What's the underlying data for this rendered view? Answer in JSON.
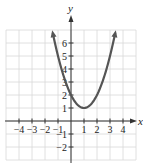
{
  "chart_data": {
    "type": "line",
    "title": "",
    "xlabel": "x",
    "ylabel": "y",
    "xlim": [
      -5,
      5
    ],
    "ylim": [
      -3,
      7
    ],
    "grid": true,
    "x_ticks": [
      -4,
      -3,
      -2,
      -1,
      1,
      2,
      3,
      4
    ],
    "y_ticks": [
      -2,
      -1,
      1,
      2,
      3,
      4,
      5,
      6
    ],
    "x_tick_labels": [
      "−4",
      "−3",
      "−2",
      "−1",
      "1",
      "2",
      "3",
      "4"
    ],
    "y_tick_labels": [
      "−2",
      "−1",
      "1",
      "2",
      "3",
      "4",
      "5",
      "6"
    ],
    "series": [
      {
        "name": "parabola",
        "equation": "y = (x − 1)^2 + 1",
        "vertex": [
          1,
          1
        ],
        "y_intercept": [
          0,
          2
        ],
        "x": [
          -1.4,
          -1,
          -0.5,
          0,
          0.5,
          1,
          1.5,
          2,
          2.5,
          3,
          3.4
        ],
        "values": [
          6.76,
          5,
          3.25,
          2,
          1.25,
          1,
          1.25,
          2,
          3.25,
          5,
          6.76
        ],
        "arrows_at_ends": true,
        "color": "#555555"
      }
    ]
  },
  "colors": {
    "grid": "#d8d8d8",
    "axes": "#333333",
    "curve": "#555555"
  }
}
